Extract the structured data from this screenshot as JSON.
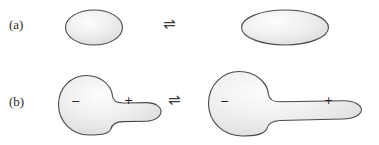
{
  "figure": {
    "background_color": "#ffffff",
    "outline_color": "#4a4a4a",
    "fill_light": "#fbfbfb",
    "fill_mid": "#ececec",
    "fill_dark": "#d8d8d8",
    "text_color": "#2b2b2b"
  },
  "rows": [
    {
      "id": "a",
      "label": "(a)",
      "relation_symbol": "⇌",
      "left_shape": {
        "name": "ellipse-compact",
        "charges": []
      },
      "right_shape": {
        "name": "ellipse-elongated",
        "charges": []
      }
    },
    {
      "id": "b",
      "label": "(b)",
      "relation_symbol": "⇌",
      "left_shape": {
        "name": "tadpole-compact",
        "charges": [
          {
            "symbol": "−",
            "position": "left-lobe"
          },
          {
            "symbol": "+",
            "position": "right-tail"
          }
        ]
      },
      "right_shape": {
        "name": "tadpole-elongated",
        "charges": [
          {
            "symbol": "−",
            "position": "left-lobe"
          },
          {
            "symbol": "+",
            "position": "right-tail"
          }
        ]
      }
    }
  ]
}
